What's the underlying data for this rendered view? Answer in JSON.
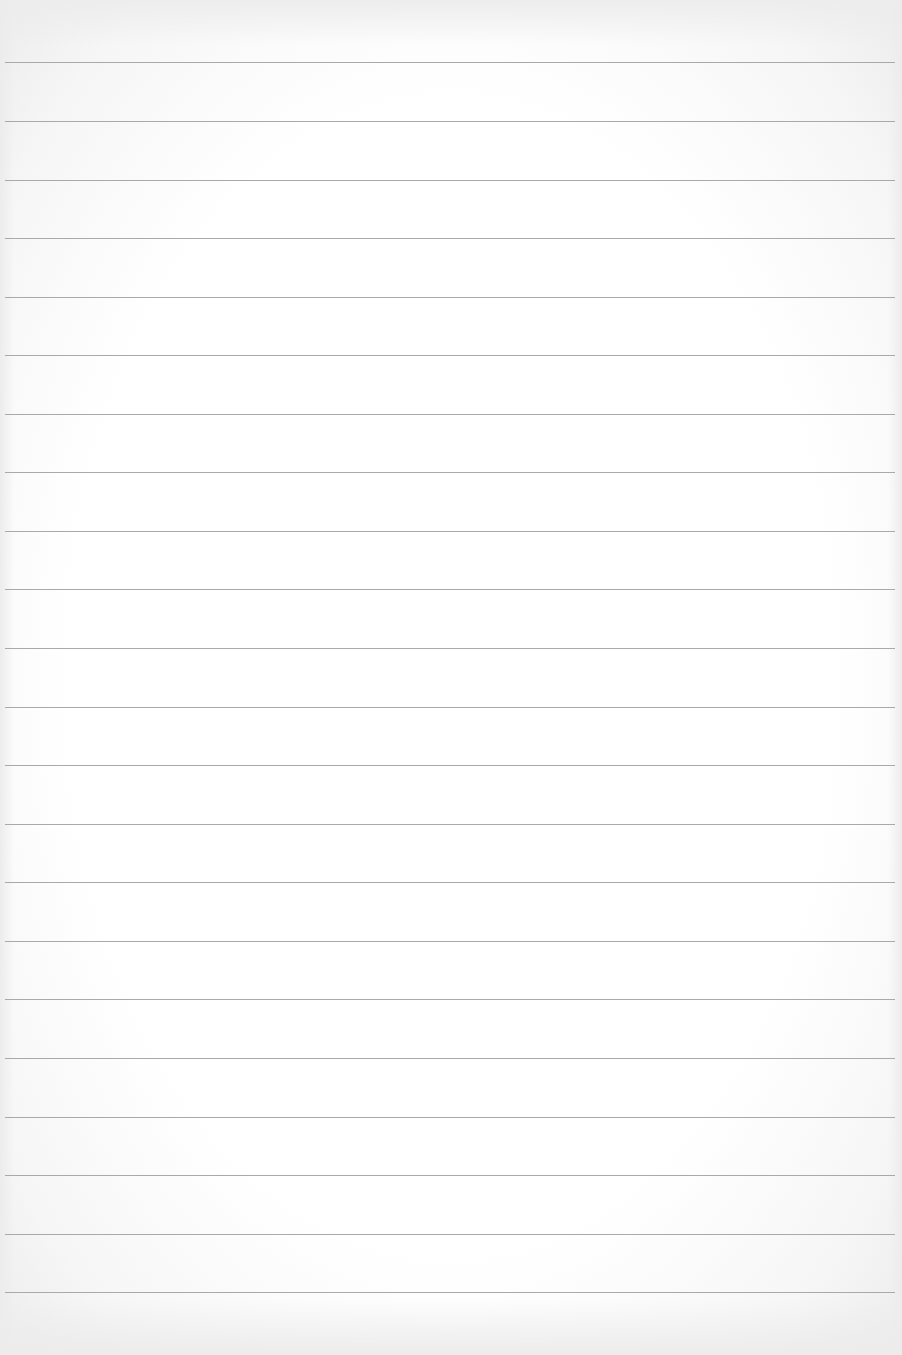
{
  "page": {
    "type": "blank lined paper",
    "background_color": "#ffffff",
    "rule_color": "#a9a9a9",
    "rule_count": 22,
    "rule_positions_y": [
      62,
      121,
      180,
      238,
      297,
      355,
      414,
      472,
      531,
      589,
      648,
      707,
      765,
      824,
      882,
      941,
      999,
      1058,
      1117,
      1175,
      1234,
      1292
    ],
    "rule_left_x": 5,
    "rule_width": 890,
    "text_content": ""
  }
}
